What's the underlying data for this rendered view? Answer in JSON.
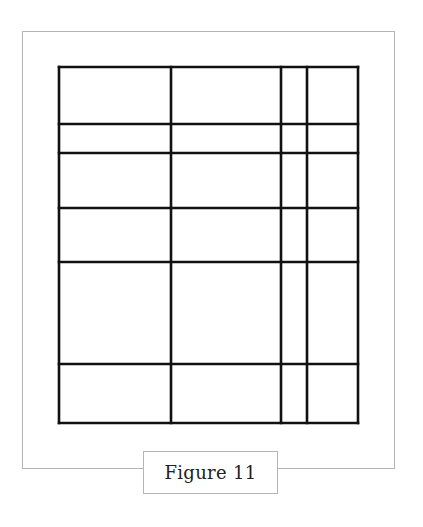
{
  "figure": {
    "caption": "Figure 11",
    "line_color": "#111111",
    "frame_color": "#b5b5b5",
    "grid": {
      "left": 59,
      "top": 67,
      "right": 358,
      "bottom": 423,
      "vertical_lines_x": [
        59,
        171,
        281,
        307,
        358
      ],
      "horizontal_lines_y": [
        67,
        124,
        153,
        208,
        262,
        364,
        423
      ],
      "stroke_width": 2.6
    }
  }
}
